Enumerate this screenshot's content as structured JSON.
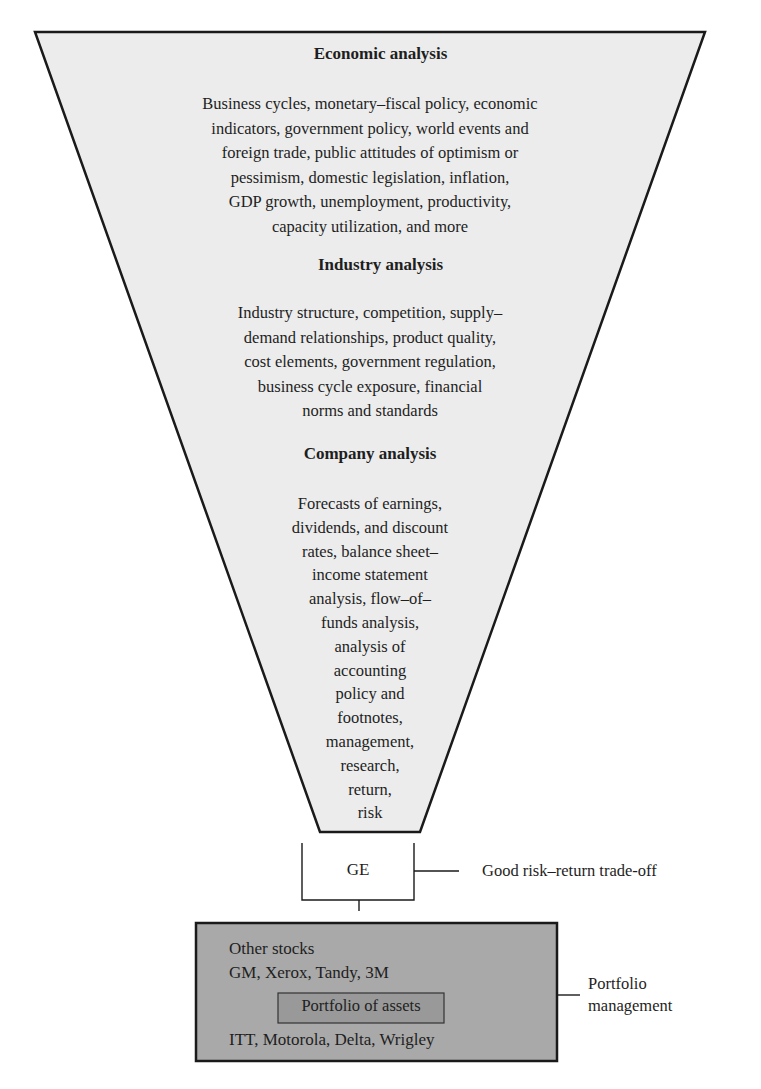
{
  "funnel": {
    "sections": [
      {
        "heading": "Economic analysis",
        "lines": [
          "Business cycles, monetary–fiscal policy, economic",
          "indicators, government policy, world events and",
          "foreign trade, public attitudes of optimism or",
          "pessimism, domestic legislation, inflation,",
          "GDP growth, unemployment, productivity,",
          "capacity utilization, and more"
        ]
      },
      {
        "heading": "Industry analysis",
        "lines": [
          "Industry structure, competition, supply–",
          "demand relationships, product quality,",
          "cost elements, government regulation,",
          "business cycle exposure, financial",
          "norms and standards"
        ]
      },
      {
        "heading": "Company analysis",
        "lines": [
          "Forecasts of earnings,",
          "dividends, and discount",
          "rates, balance sheet–",
          "income statement",
          "analysis, flow–of–",
          "funds analysis,",
          "analysis of",
          "accounting",
          "policy and",
          "footnotes,",
          "management,",
          "research,",
          "return,",
          "risk"
        ]
      }
    ]
  },
  "selection_box": {
    "label": "GE",
    "annotation": "Good risk–return trade-off"
  },
  "portfolio_box": {
    "line1": "Other stocks",
    "line2": "GM, Xerox, Tandy, 3M",
    "inner_label": "Portfolio of assets",
    "line3": "ITT, Motorola, Delta, Wrigley",
    "annotation_line1": "Portfolio",
    "annotation_line2": "management"
  },
  "colors": {
    "funnel_fill": "#ececec",
    "portfolio_fill": "#a9a9a9",
    "inner_fill": "#999999",
    "stroke": "#1a1a1a"
  }
}
